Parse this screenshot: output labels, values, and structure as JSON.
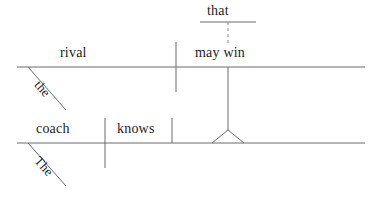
{
  "diagram": {
    "type": "reed-kellogg-sentence-diagram",
    "sentence": "The coach knows that the rival may win.",
    "background_color": "#ffffff",
    "line_color": "#6b6b6b",
    "text_color": "#1c1c1c",
    "main_clause": {
      "subject": "coach",
      "subject_modifier": "The",
      "verb": "knows",
      "object": "that clause"
    },
    "subordinate_clause": {
      "conjunction": "that",
      "subject": "rival",
      "subject_modifier": "the",
      "verb": "may win"
    },
    "labels": {
      "conjunction_that": "that",
      "upper_subject": "rival",
      "upper_verb": "may win",
      "upper_article": "the",
      "lower_subject": "coach",
      "lower_verb": "knows",
      "lower_article": "The"
    },
    "lines": {
      "upper_baseline": {
        "x1": 17,
        "y1": 67,
        "x2": 365,
        "y2": 67
      },
      "lower_baseline": {
        "x1": 17,
        "y1": 143,
        "x2": 365,
        "y2": 143
      },
      "that_bar": {
        "x1": 200,
        "y1": 22,
        "x2": 256,
        "y2": 22
      },
      "dashed_connector": {
        "x1": 228,
        "y1": 22,
        "x2": 228,
        "y2": 44,
        "style": "dashed"
      },
      "upper_subject_divider": {
        "x1": 176,
        "y1": 42,
        "x2": 176,
        "y2": 92
      },
      "lower_subject_divider": {
        "x1": 105,
        "y1": 118,
        "x2": 105,
        "y2": 168
      },
      "lower_verb_divider": {
        "x1": 172,
        "y1": 118,
        "x2": 172,
        "y2": 143
      },
      "clause_stem": {
        "x1": 228,
        "y1": 67,
        "x2": 228,
        "y2": 130
      },
      "pedestal_left": {
        "x1": 228,
        "y1": 130,
        "x2": 212,
        "y2": 143
      },
      "pedestal_right": {
        "x1": 228,
        "y1": 130,
        "x2": 244,
        "y2": 143
      },
      "upper_article_slant": {
        "x1": 28,
        "y1": 67,
        "x2": 66,
        "y2": 110
      },
      "lower_article_slant": {
        "x1": 28,
        "y1": 143,
        "x2": 66,
        "y2": 186
      }
    }
  }
}
